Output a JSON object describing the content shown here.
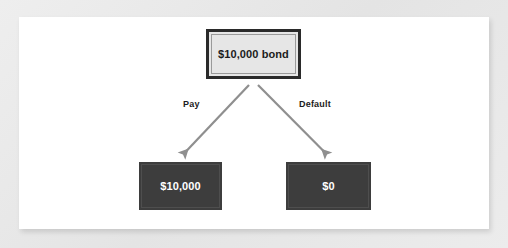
{
  "diagram": {
    "type": "decision-tree",
    "title_node": {
      "label": "$10,000 bond"
    },
    "branches": [
      {
        "label": "Pay",
        "outcome": "$10,000"
      },
      {
        "label": "Default",
        "outcome": "$0"
      }
    ],
    "outcomes": [
      {
        "name": "pay-outcome",
        "value": "$10,000"
      },
      {
        "name": "default-outcome",
        "value": "$0"
      }
    ],
    "colors": {
      "page_background": "#e9e9e9",
      "canvas": "#ffffff",
      "root_node_fill": "#e6e6e6",
      "root_node_border": "#2a2a2a",
      "root_node_text": "#1c1c1c",
      "outcome_node_fill": "#3d3d3d",
      "outcome_node_text": "#ffffff",
      "arrow": "#8f8f8f",
      "branch_label_text": "#1c1c1c"
    }
  }
}
